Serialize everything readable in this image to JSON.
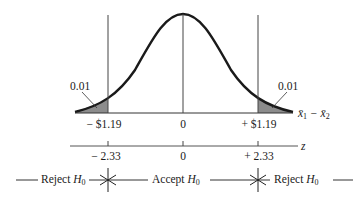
{
  "diagram": {
    "type": "normal distribution two-tailed hypothesis test",
    "tails": {
      "left_area": "0.01",
      "right_area": "0.01",
      "shade_color": "#8c8c8c"
    },
    "x_axis": {
      "label_main": "x̄",
      "label_sub1": "1",
      "label_minus": " − x̄",
      "label_sub2": "2",
      "ticks": [
        "− $1.19",
        "0",
        "+ $1.19"
      ]
    },
    "z_axis": {
      "label": "z",
      "ticks": [
        "− 2.33",
        "0",
        "+ 2.33"
      ]
    },
    "decision": {
      "left": "Reject",
      "middle": "Accept",
      "right": "Reject",
      "h": "H",
      "sub": "0"
    }
  }
}
